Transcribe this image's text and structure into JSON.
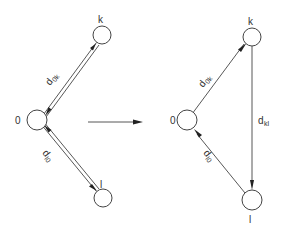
{
  "left_diagram": {
    "nodes": [
      {
        "id": "0",
        "label": "0"
      },
      {
        "id": "k",
        "label": "k"
      },
      {
        "id": "l",
        "label": "l"
      }
    ],
    "edges": [
      {
        "from": "0",
        "to": "k",
        "bidirectional": true,
        "label_main": "d",
        "label_sub": "0k"
      },
      {
        "from": "l",
        "to": "0",
        "bidirectional": true,
        "label_main": "d",
        "label_sub": "l0"
      }
    ]
  },
  "transition_arrow": {
    "direction": "right"
  },
  "right_diagram": {
    "nodes": [
      {
        "id": "0",
        "label": "0"
      },
      {
        "id": "k",
        "label": "k"
      },
      {
        "id": "l",
        "label": "l"
      }
    ],
    "edges": [
      {
        "from": "0",
        "to": "k",
        "label_main": "d",
        "label_sub": "0k"
      },
      {
        "from": "k",
        "to": "l",
        "label_main": "d",
        "label_sub": "kl"
      },
      {
        "from": "l",
        "to": "0",
        "label_main": "d",
        "label_sub": "l0"
      }
    ]
  }
}
